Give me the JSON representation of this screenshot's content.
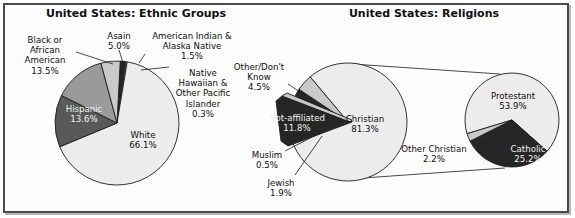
{
  "figure": {
    "width": 575,
    "height": 218,
    "background": "#ffffff",
    "frame_color": "#4a4a4a"
  },
  "palette": {
    "very_light": "#ececec",
    "light": "#d8d8d8",
    "light_gray": "#c9c9c9",
    "mid_gray": "#9a9a9a",
    "dark_gray": "#595959",
    "near_black": "#262626",
    "outline": "#1c1c1c",
    "text_dark": "#0d0d0d",
    "text_light": "#f2f2f2"
  },
  "chart_data": [
    {
      "type": "pie",
      "id": "ethnic-groups",
      "title": "United States: Ethnic Groups",
      "xlabel": "",
      "ylabel": "",
      "legend": "none",
      "grid": false,
      "total": 100,
      "categories": [
        "White",
        "Hispanic",
        "Black or African American",
        "Asain",
        "American Indian & Alaska Native",
        "Native Hawaiian & Other Pacific Islander"
      ],
      "values": [
        66.1,
        13.6,
        13.5,
        5.0,
        1.5,
        0.3
      ],
      "slices": [
        {
          "label": "White",
          "value": 66.1,
          "value_text": "66.1%",
          "color": "#ececec",
          "label_place": "inside",
          "label_x": 143,
          "label_y": 138,
          "label_lines": [
            "White",
            "66.1%"
          ],
          "text_color": "#0d0d0d",
          "anchor": "middle"
        },
        {
          "label": "Hispanic",
          "value": 13.6,
          "value_text": "13.6%",
          "color": "#595959",
          "label_place": "inside",
          "label_x": 84,
          "label_y": 112,
          "label_lines": [
            "Hispanic",
            "13.6%"
          ],
          "text_color": "#f2f2f2",
          "anchor": "middle"
        },
        {
          "label": "Black or African American",
          "value": 13.5,
          "value_text": "13.5%",
          "color": "#9a9a9a",
          "label_place": "outside",
          "label_x": 45,
          "label_y": 43,
          "label_lines": [
            "Black or",
            "African",
            "American",
            "13.5%"
          ],
          "text_color": "#0d0d0d",
          "anchor": "middle"
        },
        {
          "label": "Asain",
          "value": 5.0,
          "value_text": "5.0%",
          "color": "#c9c9c9",
          "label_place": "outside",
          "label_x": 119,
          "label_y": 39,
          "label_lines": [
            "Asain",
            "5.0%"
          ],
          "text_color": "#0d0d0d",
          "anchor": "middle"
        },
        {
          "label": "American Indian & Alaska Native",
          "value": 1.5,
          "value_text": "1.5%",
          "color": "#262626",
          "label_place": "outside",
          "label_x": 192,
          "label_y": 39,
          "label_lines": [
            "American Indian &",
            "Alaska Native",
            "1.5%"
          ],
          "text_color": "#0d0d0d",
          "anchor": "middle"
        },
        {
          "label": "Native Hawaiian & Other Pacific Islander",
          "value": 0.3,
          "value_text": "0.3%",
          "color": "#d8d8d8",
          "label_place": "outside",
          "label_x": 203,
          "label_y": 76,
          "label_lines": [
            "Native",
            "Hawaiian &",
            "Other Pacific",
            "Islander",
            "0.3%"
          ],
          "text_color": "#0d0d0d",
          "anchor": "middle"
        }
      ]
    },
    {
      "type": "pie",
      "id": "religions-main",
      "title": "United States: Religions",
      "xlabel": "",
      "ylabel": "",
      "legend": "none",
      "grid": false,
      "total": 100,
      "categories": [
        "Christian",
        "Not-affiliated",
        "Other/Don't Know",
        "Jewish",
        "Muslim"
      ],
      "values": [
        81.3,
        11.8,
        4.5,
        1.9,
        0.5
      ],
      "slices": [
        {
          "label": "Christian",
          "value": 81.3,
          "value_text": "81.3%",
          "color": "#ececec",
          "label_place": "inside",
          "label_x": 365,
          "label_y": 122,
          "label_lines": [
            "Christian",
            "81.3%"
          ],
          "text_color": "#0d0d0d",
          "anchor": "middle"
        },
        {
          "label": "Not-affiliated",
          "value": 11.8,
          "value_text": "11.8%",
          "color": "#262626",
          "label_place": "inside",
          "label_x": 297,
          "label_y": 121,
          "label_lines": [
            "Not-affiliated",
            "11.8%"
          ],
          "text_color": "#f2f2f2",
          "anchor": "middle"
        },
        {
          "label": "Other/Don't Know",
          "value": 4.5,
          "value_text": "4.5%",
          "color": "#c9c9c9",
          "label_place": "outside",
          "label_x": 259,
          "label_y": 70,
          "label_lines": [
            "Other/Don't",
            "Know",
            "4.5%"
          ],
          "text_color": "#0d0d0d",
          "anchor": "middle"
        },
        {
          "label": "Jewish",
          "value": 1.9,
          "value_text": "1.9%",
          "color": "#d8d8d8",
          "label_place": "outside",
          "label_x": 281,
          "label_y": 186,
          "label_lines": [
            "Jewish",
            "1.9%"
          ],
          "text_color": "#0d0d0d",
          "anchor": "middle"
        },
        {
          "label": "Muslim",
          "value": 0.5,
          "value_text": "0.5%",
          "color": "#9a9a9a",
          "label_place": "outside",
          "label_x": 267,
          "label_y": 158,
          "label_lines": [
            "Muslim",
            "0.5%"
          ],
          "text_color": "#0d0d0d",
          "anchor": "middle"
        }
      ]
    },
    {
      "type": "pie",
      "id": "christian-breakout",
      "title": "",
      "xlabel": "",
      "ylabel": "",
      "legend": "none",
      "grid": false,
      "note": "Breakout of the Christian slice",
      "total": 81.3,
      "categories": [
        "Protestant",
        "Catholic",
        "Other Christian"
      ],
      "values": [
        53.9,
        25.2,
        2.2
      ],
      "slices": [
        {
          "label": "Protestant",
          "value": 53.9,
          "value_text": "53.9%",
          "color": "#ececec",
          "label_place": "inside",
          "label_x": 513,
          "label_y": 99,
          "label_lines": [
            "Protestant",
            "53.9%"
          ],
          "text_color": "#0d0d0d",
          "anchor": "middle"
        },
        {
          "label": "Catholic",
          "value": 25.2,
          "value_text": "25.2%",
          "color": "#262626",
          "label_place": "inside",
          "label_x": 528,
          "label_y": 152,
          "label_lines": [
            "Catholic",
            "25.2%"
          ],
          "text_color": "#f2f2f2",
          "anchor": "middle"
        },
        {
          "label": "Other Christian",
          "value": 2.2,
          "value_text": "2.2%",
          "color": "#c9c9c9",
          "label_place": "outside",
          "label_x": 434,
          "label_y": 152,
          "label_lines": [
            "Other Christian",
            "2.2%"
          ],
          "text_color": "#0d0d0d",
          "anchor": "middle"
        }
      ]
    }
  ],
  "titles": {
    "left": "United States: Ethnic Groups",
    "right": "United States: Religions",
    "left_x": 136,
    "left_y": 17,
    "right_x": 424,
    "right_y": 17
  }
}
